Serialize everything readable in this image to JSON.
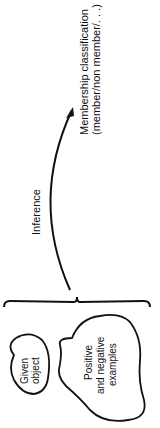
{
  "diagram": {
    "orientation": "rotated-90-ccw",
    "labels": {
      "target_line1": "Membership classification",
      "target_line2": "(member/non member/. . .)",
      "arrow_label": "Inference",
      "given_line1": "Given",
      "given_line2": "object",
      "examples_line1": "Positive",
      "examples_line2": "and negative",
      "examples_line3": "examples"
    },
    "colors": {
      "stroke": "#111111",
      "background": "#ffffff"
    }
  }
}
